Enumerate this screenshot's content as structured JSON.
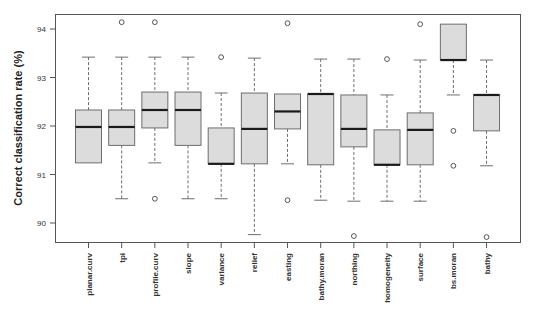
{
  "chart_data": {
    "type": "boxplot",
    "title": "",
    "xlabel": "",
    "ylabel": "Correct classification rate (%)",
    "ylim": [
      89.6,
      94.4
    ],
    "yticks": [
      90,
      91,
      92,
      93,
      94
    ],
    "grid": false,
    "legend": null,
    "colors": {
      "box_fill": "#dcdcdc",
      "box_border": "#6e6e6e",
      "median": "#1a1a1a",
      "whisker": "#6e6e6e",
      "axis": "#555555"
    },
    "categories": [
      "planar.curv",
      "tpi",
      "profile.curv",
      "slope",
      "variance",
      "relief",
      "easting",
      "bathy.moran",
      "northing",
      "homogeneity",
      "surface",
      "bs.moran",
      "bathy"
    ],
    "boxes": [
      {
        "name": "planar.curv",
        "min": 91.24,
        "q1": 91.24,
        "median": 91.98,
        "q3": 92.33,
        "max": 93.42,
        "outliers": []
      },
      {
        "name": "tpi",
        "min": 90.5,
        "q1": 91.6,
        "median": 91.98,
        "q3": 92.33,
        "max": 93.42,
        "outliers": [
          94.14
        ]
      },
      {
        "name": "profile.curv",
        "min": 91.24,
        "q1": 91.96,
        "median": 92.33,
        "q3": 92.7,
        "max": 93.42,
        "outliers": [
          94.14,
          90.5
        ]
      },
      {
        "name": "slope",
        "min": 90.5,
        "q1": 91.6,
        "median": 92.33,
        "q3": 92.7,
        "max": 93.42,
        "outliers": []
      },
      {
        "name": "variance",
        "min": 90.5,
        "q1": 91.22,
        "median": 91.22,
        "q3": 91.96,
        "max": 92.68,
        "outliers": [
          93.42
        ]
      },
      {
        "name": "relief",
        "min": 89.76,
        "q1": 91.22,
        "median": 91.94,
        "q3": 92.68,
        "max": 93.4,
        "outliers": []
      },
      {
        "name": "easting",
        "min": 91.22,
        "q1": 91.94,
        "median": 92.3,
        "q3": 92.66,
        "max": 92.66,
        "outliers": [
          94.12,
          90.47
        ]
      },
      {
        "name": "bathy.moran",
        "min": 90.47,
        "q1": 91.2,
        "median": 92.66,
        "q3": 92.66,
        "max": 93.38,
        "outliers": []
      },
      {
        "name": "northing",
        "min": 90.45,
        "q1": 91.57,
        "median": 91.94,
        "q3": 92.64,
        "max": 93.38,
        "outliers": [
          89.73
        ]
      },
      {
        "name": "homogeneity",
        "min": 90.45,
        "q1": 91.2,
        "median": 91.2,
        "q3": 91.92,
        "max": 92.64,
        "outliers": [
          93.38
        ]
      },
      {
        "name": "surface",
        "min": 90.45,
        "q1": 91.2,
        "median": 91.92,
        "q3": 92.27,
        "max": 93.36,
        "outliers": [
          94.1
        ]
      },
      {
        "name": "bs.moran",
        "min": 92.64,
        "q1": 93.36,
        "median": 93.36,
        "q3": 94.1,
        "max": 94.1,
        "outliers": [
          91.9,
          91.18
        ]
      },
      {
        "name": "bathy",
        "min": 91.18,
        "q1": 91.9,
        "median": 92.64,
        "q3": 92.64,
        "max": 93.36,
        "outliers": [
          89.71
        ]
      }
    ]
  }
}
